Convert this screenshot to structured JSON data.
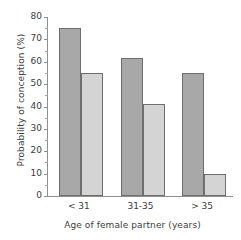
{
  "chart_data": {
    "type": "bar",
    "title": "",
    "subtitle": "",
    "xlabel": "Age of female partner (years)",
    "ylabel": "Probability of conception (%)",
    "categories": [
      "< 31",
      "31-35",
      "> 35"
    ],
    "series": [
      {
        "name": "series-1-dark",
        "color": "#a8a8a8",
        "values": [
          75,
          61.5,
          55
        ]
      },
      {
        "name": "series-2-light",
        "color": "#d4d4d4",
        "values": [
          55,
          41,
          10
        ]
      }
    ],
    "ylim": [
      0,
      80
    ],
    "ytick_values": [
      0,
      10,
      20,
      30,
      40,
      50,
      60,
      70,
      80
    ],
    "ytick_labels": [
      "0",
      "10",
      "20",
      "30",
      "40",
      "50",
      "60",
      "70",
      "80"
    ],
    "yminor_values": [
      5,
      15,
      25,
      35,
      45,
      55,
      65,
      75
    ],
    "grid": false,
    "legend": "none",
    "annotations": [],
    "bar_edge_color": "#6e6e6e",
    "axis_color": "#8e8e8e",
    "background": "#ffffff"
  }
}
